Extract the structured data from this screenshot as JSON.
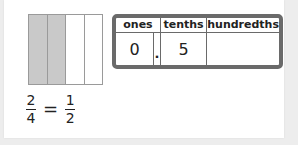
{
  "fraction_bar": {
    "parts": 4,
    "shaded": [
      true,
      true,
      false,
      false
    ],
    "shade_color": "#c9c9c9"
  },
  "equation": {
    "left": {
      "numerator": "2",
      "denominator": "4"
    },
    "operator": "=",
    "right": {
      "numerator": "1",
      "denominator": "2"
    }
  },
  "place_value_table": {
    "headers": {
      "ones": "ones",
      "tenths": "tenths",
      "hundredths": "hundredths"
    },
    "values": {
      "ones": "0",
      "decimal_point": ".",
      "tenths": "5",
      "hundredths": ""
    }
  }
}
